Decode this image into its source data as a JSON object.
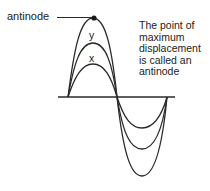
{
  "diagram": {
    "labels": {
      "antinode": "antinode",
      "caption_lines": [
        "The point of",
        "maximum",
        "displacement",
        "is called an",
        "antinode"
      ],
      "curve_y": "y",
      "curve_x": "x"
    },
    "geometry": {
      "axis": {
        "x1": 58,
        "x2": 175,
        "y": 97
      },
      "nodes_x": [
        68,
        117,
        167
      ],
      "antinode_point": {
        "x": 94,
        "y": 18
      },
      "upper_peaks_y": [
        18,
        43,
        64
      ],
      "lower_troughs_y": [
        128,
        149,
        176
      ],
      "leader_line": {
        "x1": 57,
        "x2": 94,
        "y": 17
      }
    },
    "colors": {
      "stroke": "#2a2a2a",
      "background": "#ffffff"
    }
  }
}
